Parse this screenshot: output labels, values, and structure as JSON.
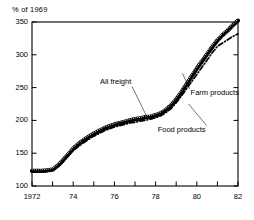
{
  "chart_data": {
    "type": "line",
    "title": "",
    "ylabel": "% of 1969",
    "xlabel": "",
    "ylim": [
      100,
      350
    ],
    "xlim": [
      1972,
      1982
    ],
    "grid": false,
    "legend_position": "inline-annotations",
    "ytick_labels": [
      "350",
      "300",
      "250",
      "200",
      "150",
      "100"
    ],
    "ytick_values": [
      350,
      300,
      250,
      200,
      150,
      100
    ],
    "xtick_labels": [
      "1972",
      "74",
      "76",
      "78",
      "80",
      "82"
    ],
    "xtick_values": [
      1972,
      1974,
      1976,
      1978,
      1980,
      1982
    ],
    "xtick_minor_values": [
      1973,
      1975,
      1977,
      1979,
      1981
    ],
    "x": [
      1972.0,
      1972.25,
      1972.5,
      1972.75,
      1973.0,
      1973.25,
      1973.5,
      1973.75,
      1974.0,
      1974.25,
      1974.5,
      1974.75,
      1975.0,
      1975.25,
      1975.5,
      1975.75,
      1976.0,
      1976.25,
      1976.5,
      1976.75,
      1977.0,
      1977.25,
      1977.5,
      1977.75,
      1978.0,
      1978.25,
      1978.5,
      1978.75,
      1979.0,
      1979.25,
      1979.5,
      1979.75,
      1980.0,
      1980.25,
      1980.5,
      1980.75,
      1981.0,
      1981.25,
      1981.5,
      1981.75,
      1982.0
    ],
    "series": [
      {
        "name": "All freight",
        "style": "stippled-thick",
        "values": [
          123,
          123,
          123,
          124,
          125,
          131,
          139,
          148,
          157,
          164,
          170,
          175,
          180,
          184,
          188,
          191,
          194,
          196,
          198,
          200,
          202,
          203,
          205,
          206,
          208,
          211,
          216,
          223,
          232,
          243,
          255,
          267,
          279,
          290,
          301,
          312,
          322,
          330,
          337,
          345,
          352
        ]
      },
      {
        "name": "Food products",
        "style": "solid",
        "values": [
          122,
          122,
          122,
          123,
          124,
          130,
          138,
          147,
          155,
          162,
          168,
          173,
          178,
          182,
          186,
          189,
          192,
          194,
          196,
          198,
          200,
          201,
          203,
          204,
          206,
          209,
          214,
          221,
          230,
          241,
          253,
          265,
          277,
          288,
          299,
          310,
          320,
          329,
          336,
          344,
          351
        ]
      },
      {
        "name": "Farm products",
        "style": "dash-dot",
        "values": [
          121,
          121,
          121,
          122,
          123,
          129,
          137,
          146,
          154,
          160,
          166,
          171,
          176,
          180,
          184,
          187,
          190,
          192,
          194,
          196,
          197,
          199,
          200,
          202,
          204,
          207,
          212,
          218,
          227,
          237,
          248,
          259,
          270,
          281,
          292,
          303,
          313,
          318,
          323,
          328,
          332
        ]
      }
    ],
    "annotations": [
      {
        "text": "All freight",
        "label_x": 1975.3,
        "label_y": 258,
        "target_x": 1977.6,
        "target_y": 204
      },
      {
        "text": "Farm products",
        "label_x": 1979.7,
        "label_y": 242,
        "target_x": 1979.3,
        "target_y": 272
      },
      {
        "text": "Food products",
        "label_x": 1978.1,
        "label_y": 186,
        "target_x": 1979.6,
        "target_y": 225
      }
    ]
  }
}
